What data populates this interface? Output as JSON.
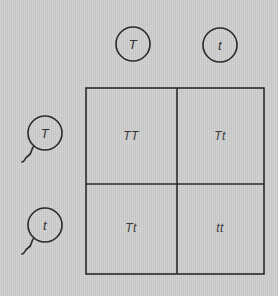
{
  "diagram": {
    "type": "punnett-square",
    "background_color": "#cecece",
    "line_color": "#2a2a2a",
    "column_gametes": [
      {
        "allele": "T",
        "kind": "egg"
      },
      {
        "allele": "t",
        "kind": "egg"
      }
    ],
    "row_gametes": [
      {
        "allele": "T",
        "kind": "sperm"
      },
      {
        "allele": "t",
        "kind": "sperm"
      }
    ],
    "cells": [
      [
        "TT",
        "Tt"
      ],
      [
        "Tt",
        "tt"
      ]
    ]
  }
}
